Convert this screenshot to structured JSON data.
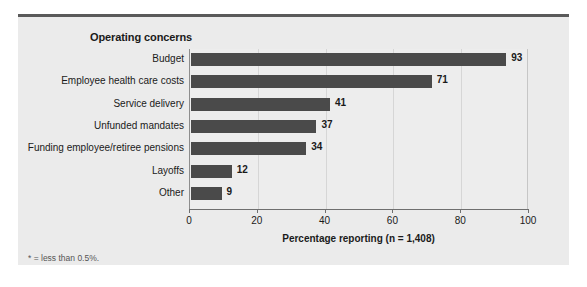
{
  "clipped_top_text": "",
  "panel": {
    "header": "Operating concerns",
    "footnote": "* = less than 0.5%."
  },
  "colors": {
    "bar": "#4a4a4a",
    "panel_background": "#ebebeb",
    "plot_background": "#ededed",
    "top_rule": "#5a5a5a",
    "gridline": "#d6d6d6",
    "axis": "#6f6f6f",
    "text": "#1a1a1a"
  },
  "chart_data": {
    "type": "bar",
    "orientation": "horizontal",
    "title": "Operating concerns",
    "xlabel": "Percentage reporting (n = 1,408)",
    "ylabel": "",
    "categories": [
      "Budget",
      "Employee health care costs",
      "Service delivery",
      "Unfunded mandates",
      "Funding employee/retiree pensions",
      "Layoffs",
      "Other"
    ],
    "values": [
      93,
      71,
      41,
      37,
      34,
      12,
      9
    ],
    "value_labels": [
      "93",
      "71",
      "41",
      "37",
      "34",
      "12",
      "9"
    ],
    "xlim": [
      0,
      100
    ],
    "xticks": [
      0,
      20,
      40,
      60,
      80,
      100
    ],
    "xtick_labels": [
      "0",
      "20",
      "40",
      "60",
      "80",
      "100"
    ],
    "grid": true,
    "grid_axis": "x",
    "legend": false,
    "annotations": [
      "* = less than 0.5%."
    ]
  }
}
